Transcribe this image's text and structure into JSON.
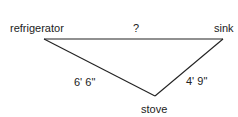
{
  "diagram": {
    "vertices": {
      "refrigerator": "refrigerator",
      "sink": "sink",
      "stove": "stove"
    },
    "edges": {
      "refrigerator_sink": "?",
      "refrigerator_stove": "6' 6\"",
      "stove_sink": "4' 9\""
    },
    "line_color": "#222222"
  }
}
